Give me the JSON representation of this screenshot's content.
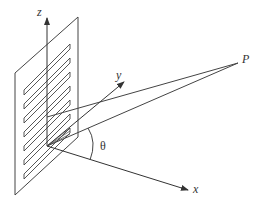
{
  "diagram": {
    "type": "3d-coordinate-geometry",
    "labels": {
      "z_axis": "z",
      "y_axis": "y",
      "x_axis": "x",
      "point": "P",
      "angle": "θ"
    },
    "colors": {
      "stroke": "#444444",
      "background": "#ffffff"
    },
    "origin": [
      47,
      146
    ],
    "point_P": [
      238,
      63
    ],
    "panel": {
      "corners": [
        [
          78,
          17
        ],
        [
          78,
          137
        ],
        [
          15,
          195
        ],
        [
          15,
          73
        ]
      ],
      "slat_count": 7
    }
  }
}
